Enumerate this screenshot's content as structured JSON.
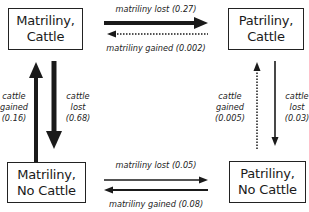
{
  "diagram": {
    "type": "state-transition",
    "states": [
      {
        "id": "matriliny_cattle",
        "line1": "Matriliny,",
        "line2": "Cattle"
      },
      {
        "id": "patriliny_cattle",
        "line1": "Patriliny,",
        "line2": "Cattle"
      },
      {
        "id": "matriliny_no_cattle",
        "line1": "Matriliny,",
        "line2": "No Cattle"
      },
      {
        "id": "patriliny_no_cattle",
        "line1": "Patriliny,",
        "line2": "No Cattle"
      }
    ],
    "transitions": [
      {
        "from": "matriliny_cattle",
        "to": "patriliny_cattle",
        "label": "matriliny lost",
        "rate": "(0.27)",
        "style": "thick-solid"
      },
      {
        "from": "patriliny_cattle",
        "to": "matriliny_cattle",
        "label": "matriliny gained",
        "rate": "(0.002)",
        "style": "dotted"
      },
      {
        "from": "matriliny_no_cattle",
        "to": "matriliny_cattle",
        "label_line1": "cattle",
        "label_line2": "gained",
        "rate": "(0.16)",
        "style": "thick-solid"
      },
      {
        "from": "matriliny_cattle",
        "to": "matriliny_no_cattle",
        "label_line1": "cattle",
        "label_line2": "lost",
        "rate": "(0.68)",
        "style": "very-thick-solid"
      },
      {
        "from": "patriliny_no_cattle",
        "to": "patriliny_cattle",
        "label_line1": "cattle",
        "label_line2": "gained",
        "rate": "(0.005)",
        "style": "dotted"
      },
      {
        "from": "patriliny_cattle",
        "to": "patriliny_no_cattle",
        "label_line1": "cattle",
        "label_line2": "lost",
        "rate": "(0.03)",
        "style": "thin-solid"
      },
      {
        "from": "matriliny_no_cattle",
        "to": "patriliny_no_cattle",
        "label": "matriliny lost",
        "rate": "(0.05)",
        "style": "thin-solid"
      },
      {
        "from": "patriliny_no_cattle",
        "to": "matriliny_no_cattle",
        "label": "matriliny gained",
        "rate": "(0.08)",
        "style": "thin-solid"
      }
    ]
  }
}
